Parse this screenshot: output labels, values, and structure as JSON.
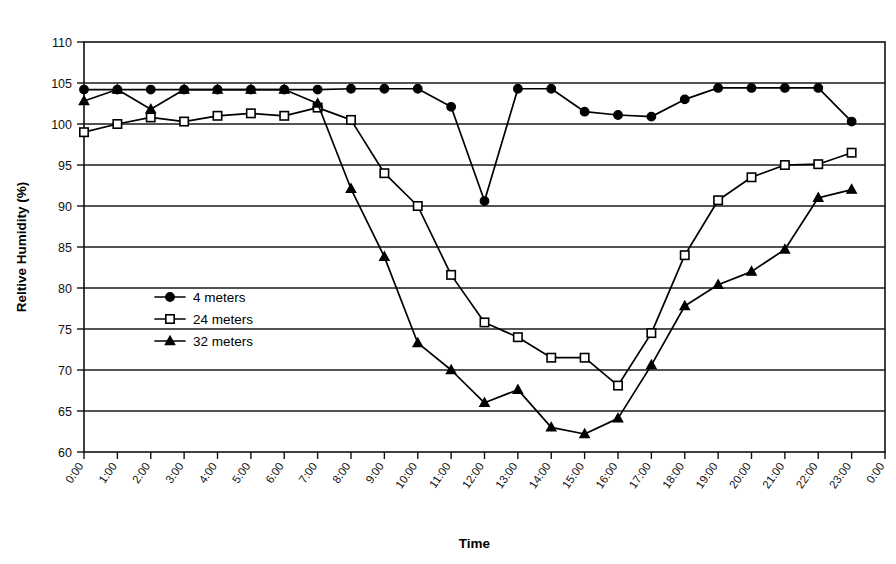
{
  "chart_data": {
    "type": "line",
    "title": "",
    "xlabel": "Time",
    "ylabel": "Reltive Humidity (%)",
    "ylim": [
      60,
      110
    ],
    "ytick_step": 5,
    "yticks": [
      60,
      65,
      70,
      75,
      80,
      85,
      90,
      95,
      100,
      105,
      110
    ],
    "grid": "horizontal",
    "legend_position": "inside-left",
    "x": [
      "0:00",
      "1:00",
      "2:00",
      "3:00",
      "4:00",
      "5:00",
      "6:00",
      "7:00",
      "8:00",
      "9:00",
      "10:00",
      "11:00",
      "12:00",
      "13:00",
      "14:00",
      "15:00",
      "16:00",
      "17:00",
      "18:00",
      "19:00",
      "20:00",
      "21:00",
      "22:00",
      "23:00",
      "0:00"
    ],
    "xtick_labels": [
      "0:00",
      "1:00",
      "2:00",
      "3:00",
      "4:00",
      "5:00",
      "6:00",
      "7:00",
      "8:00",
      "9:00",
      "10:00",
      "11:00",
      "12:00",
      "13:00",
      "14:00",
      "15:00",
      "16:00",
      "17:00",
      "18:00",
      "19:00",
      "20:00",
      "21:00",
      "22:00",
      "23:00",
      "0:00"
    ],
    "series": [
      {
        "name": "4 meters",
        "marker": "filled-circle",
        "values": [
          104.2,
          104.2,
          104.2,
          104.2,
          104.2,
          104.2,
          104.2,
          104.2,
          104.3,
          104.3,
          104.3,
          102.1,
          90.6,
          104.3,
          104.3,
          101.5,
          101.1,
          100.9,
          103.0,
          104.4,
          104.4,
          104.4,
          104.4,
          100.3,
          null
        ]
      },
      {
        "name": "24 meters",
        "marker": "open-square",
        "values": [
          99.0,
          100.0,
          100.8,
          100.3,
          101.0,
          101.3,
          101.0,
          102.0,
          100.5,
          94.0,
          90.0,
          81.6,
          75.8,
          74.0,
          71.5,
          71.5,
          68.1,
          74.5,
          84.0,
          90.7,
          93.5,
          95.0,
          95.1,
          96.5,
          null
        ]
      },
      {
        "name": "32 meters",
        "marker": "filled-triangle",
        "values": [
          102.8,
          104.2,
          101.8,
          104.2,
          104.2,
          104.2,
          104.2,
          102.5,
          92.1,
          83.8,
          73.3,
          70.0,
          66.0,
          67.6,
          63.0,
          62.2,
          64.1,
          70.6,
          77.8,
          80.4,
          82.0,
          84.7,
          91.0,
          92.0,
          null
        ]
      }
    ]
  },
  "legend": {
    "items": [
      {
        "label": "4 meters"
      },
      {
        "label": "24 meters"
      },
      {
        "label": "32 meters"
      }
    ]
  },
  "axes": {
    "y_title": "Reltive Humidity (%)",
    "x_title": "Time"
  }
}
